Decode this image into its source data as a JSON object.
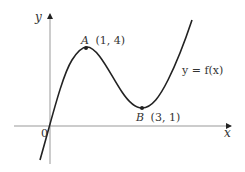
{
  "diagram": {
    "type": "function-graph",
    "axes": {
      "x_label": "x",
      "y_label": "y",
      "origin_label": "0"
    },
    "curve_label": "y = f(x)",
    "points": [
      {
        "name": "A",
        "coords": "(1, 4)",
        "kind": "local maximum"
      },
      {
        "name": "B",
        "coords": "(3, 1)",
        "kind": "local minimum"
      }
    ],
    "colors": {
      "axis": "#888888",
      "curve": "#222222",
      "text": "#333333"
    }
  }
}
